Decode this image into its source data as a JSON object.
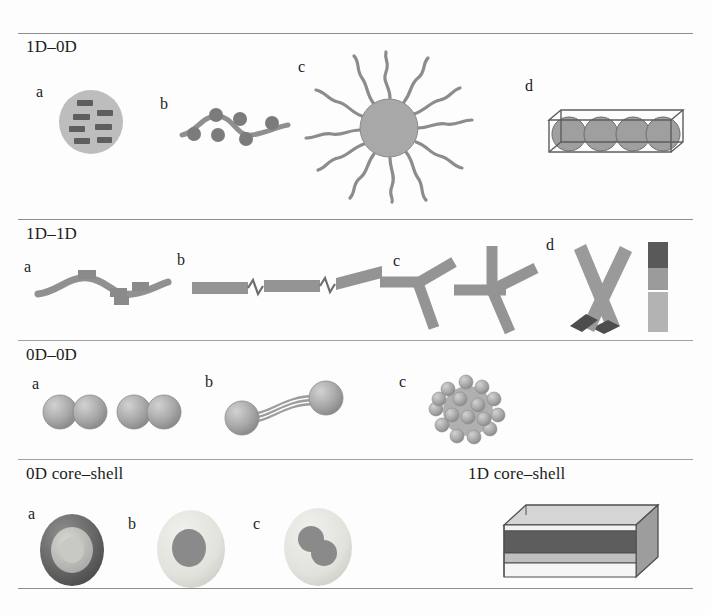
{
  "figure": {
    "background_color": "#fdfdfd",
    "rule_color": "#8d8d8d"
  },
  "palette": {
    "gray_mid": "#9a9a9a",
    "gray_light": "#c4c4c4",
    "gray_lighter": "#dcdcdc",
    "gray_dark": "#6f6f6f",
    "gray_darkest": "#4a4a4a",
    "shell_light": "#e4e4e0",
    "outline": "#5a5a5a",
    "text": "#1c1c1c"
  },
  "sections": [
    {
      "id": "1d-0d",
      "label": "1D–0D",
      "panels": [
        {
          "letter": "a",
          "name": "sphere-with-embedded-rods"
        },
        {
          "letter": "b",
          "name": "wavy-chain-decorated-with-spheres"
        },
        {
          "letter": "c",
          "name": "sphere-with-radiating-polymer-chains"
        },
        {
          "letter": "d",
          "name": "nanotube-filled-with-spheres"
        }
      ]
    },
    {
      "id": "1d-1d",
      "label": "1D–1D",
      "panels": [
        {
          "letter": "a",
          "name": "wavy-rod-with-blocks"
        },
        {
          "letter": "b",
          "name": "rods-joined-by-zigzag-linkers"
        },
        {
          "letter": "c",
          "name": "y-and-cross-rod-junctions"
        },
        {
          "letter": "d",
          "name": "crossed-rods-and-striped-segmented-rod"
        }
      ]
    },
    {
      "id": "0d-0d",
      "label": "0D–0D",
      "panels": [
        {
          "letter": "a",
          "name": "sphere-dimers"
        },
        {
          "letter": "b",
          "name": "spheres-linked-by-triple-strands"
        },
        {
          "letter": "c",
          "name": "sphere-cluster-aggregate"
        }
      ]
    },
    {
      "id": "core-shell",
      "label": "0D core–shell",
      "label_right": "1D core–shell",
      "panels": [
        {
          "letter": "a",
          "name": "dark-shell-light-core-sphere"
        },
        {
          "letter": "b",
          "name": "light-shell-dark-core-sphere"
        },
        {
          "letter": "c",
          "name": "light-shell-two-dark-cores-sphere"
        },
        {
          "letter": "",
          "name": "striped-core-shell-nanobar"
        }
      ]
    }
  ]
}
